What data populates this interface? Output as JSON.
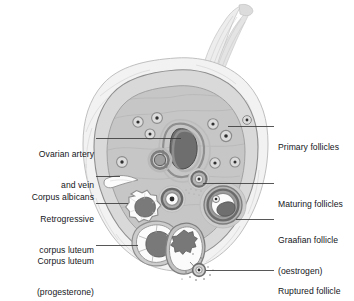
{
  "figure": {
    "palette": {
      "background": "#ffffff",
      "outer_capsule": "#f2f2f2",
      "outer_capsule_edge": "#b9b9b9",
      "cortex": "#d8d8d8",
      "medulla": "#c3c3c3",
      "medulla_inner": "#b5b5b5",
      "vessel_dark": "#6e6e6e",
      "vessel_mid": "#8f8f8f",
      "follicle_ring": "#8a8a8a",
      "follicle_core": "#3d3d3d",
      "luteum_white": "#fbfbfb",
      "luteum_core": "#777777",
      "stalk": "#eaeaea",
      "leader_line": "#3a3a3a",
      "text": "#14161a"
    }
  },
  "labels": {
    "left": [
      {
        "id": "ovarian-artery-and-vein",
        "line1": "Ovarian artery",
        "line2": "and vein"
      },
      {
        "id": "corpus-albicans",
        "line1": "Corpus albicans",
        "line2": ""
      },
      {
        "id": "retrogressive-corpus-luteum",
        "line1": "Retrogressive",
        "line2": "corpus luteum"
      },
      {
        "id": "corpus-luteum-progesterone",
        "line1": "Corpus luteum",
        "line2": "(progesterone)"
      }
    ],
    "right": [
      {
        "id": "primary-follicles",
        "line1": "Primary follicles",
        "line2": ""
      },
      {
        "id": "maturing-follicles",
        "line1": "Maturing follicles",
        "line2": ""
      },
      {
        "id": "graafian-follicle-oestrogen",
        "line1": "Graafian follicle",
        "line2": "(oestrogen)"
      },
      {
        "id": "ruptured-follicle",
        "line1": "Ruptured follicle",
        "line2": ""
      }
    ]
  },
  "structures": {
    "ovary_outline": "lobed ovoid capsule with attachment stalk at top",
    "stalk": "mesovarium / suspensory attachment at top",
    "cortex_band": "outer granular cortex band",
    "medulla": "inner medulla containing vasculature",
    "primordial_follicle_count": 9,
    "expelled_ovum": "ovum released at rupture site with surrounding corona dots"
  }
}
